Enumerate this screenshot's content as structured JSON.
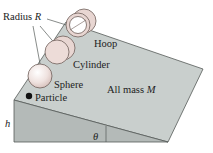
{
  "diagram": {
    "labels": {
      "radius": "Radius ",
      "radius_symbol": "R",
      "hoop": "Hoop",
      "cylinder": "Cylinder",
      "sphere": "Sphere",
      "particle": "Particle",
      "mass": "All mass ",
      "mass_symbol": "M",
      "height": "h",
      "angle": "θ"
    },
    "objects": [
      "Hoop",
      "Cylinder",
      "Sphere",
      "Particle"
    ],
    "colors": {
      "incline_top": "#c9cfcd",
      "incline_front": "#b4bab8",
      "edge": "#555a58",
      "body_fill": "#e8d6d2",
      "body_edge": "#6f5f5a",
      "particle": "#111111"
    }
  }
}
